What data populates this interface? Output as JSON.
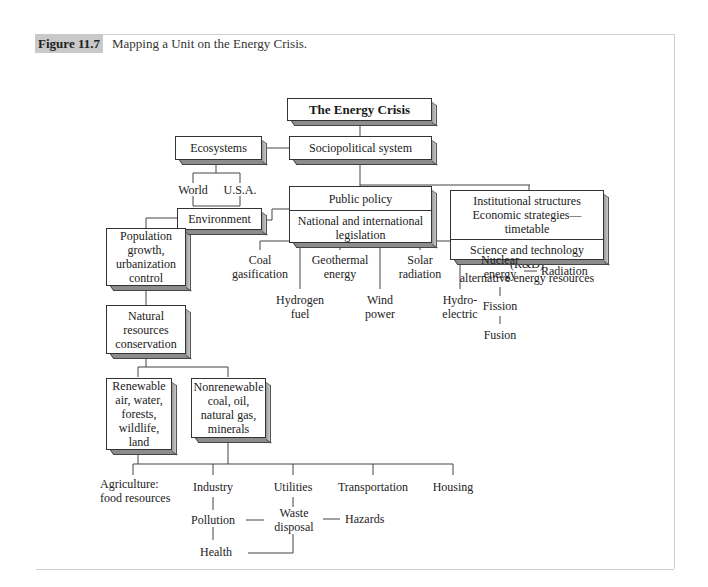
{
  "figure": {
    "label": "Figure 11.7",
    "caption": "Mapping a Unit on the Energy Crisis."
  },
  "boxes": {
    "root": "The Energy Crisis",
    "sociopolitical": "Sociopolitical system",
    "ecosystems": "Ecosystems",
    "public_policy": {
      "top": "Public policy",
      "bottom_l1": "National and international",
      "bottom_l2": "legislation"
    },
    "institutional": {
      "top_l1": "Institutional structures",
      "top_l2": "Economic strategies—timetable",
      "bottom_l1": "Science and technology (R&D)",
      "bottom_l2": "alternative energy resources"
    },
    "environment": "Environment",
    "population": [
      "Population",
      "growth,",
      "urbanization",
      "control"
    ],
    "natural_resources": [
      "Natural",
      "resources",
      "conservation"
    ],
    "renewable": [
      "Renewable",
      "air, water,",
      "forests,",
      "wildlife,",
      "land"
    ],
    "nonrenewable": [
      "Nonrenewable",
      "coal, oil,",
      "natural gas,",
      "minerals"
    ]
  },
  "labels": {
    "ecosystem_children": [
      "World",
      "U.S.A."
    ],
    "energy_sources": {
      "coal": [
        "Coal",
        "gasification"
      ],
      "hydrogen": [
        "Hydrogen",
        "fuel"
      ],
      "geothermal": [
        "Geothermal",
        "energy"
      ],
      "wind": [
        "Wind",
        "power"
      ],
      "solar": [
        "Solar",
        "radiation"
      ],
      "hydro": [
        "Hydro-",
        "electric"
      ],
      "nuclear": [
        "Nuclear",
        "energy"
      ],
      "radiation": "Radiation",
      "fission": "Fission",
      "fusion": "Fusion"
    },
    "sectors": {
      "agriculture": [
        "Agriculture:",
        "food resources"
      ],
      "industry": "Industry",
      "utilities": "Utilities",
      "transportation": "Transportation",
      "housing": "Housing",
      "pollution": "Pollution",
      "waste": [
        "Waste",
        "disposal"
      ],
      "hazards": "Hazards",
      "health": "Health"
    }
  },
  "colors": {
    "label_bg": "#c9c9c9",
    "frame": "#cfcfcf",
    "line": "#444444",
    "box_shadow": "#8c8c8c"
  }
}
